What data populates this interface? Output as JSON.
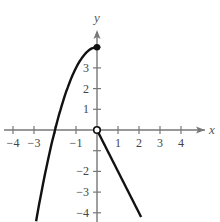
{
  "chart_data": {
    "type": "line",
    "title": "",
    "xlabel": "x",
    "ylabel": "y",
    "xlim": [
      -4.5,
      5
    ],
    "ylim": [
      -4.5,
      5
    ],
    "x_ticks": [
      "-4",
      "-3",
      "-1",
      "1",
      "2",
      "3",
      "4"
    ],
    "y_ticks": [
      "-4",
      "-3",
      "-2",
      "1",
      "2",
      "3"
    ],
    "grid": false,
    "series": [
      {
        "name": "f(x) = 4 - x^2, x <= 0",
        "x": [
          -2.83,
          -2,
          -1,
          0
        ],
        "y": [
          -4,
          0,
          3,
          4
        ],
        "endpoint": {
          "x": 0,
          "y": 4,
          "style": "closed"
        }
      },
      {
        "name": "f(x) = -2x, x > 0",
        "x": [
          0,
          2
        ],
        "y": [
          0,
          -4
        ],
        "endpoint": {
          "x": 0,
          "y": 0,
          "style": "open"
        }
      }
    ]
  },
  "labels": {
    "x_axis": "x",
    "y_axis": "y",
    "xticks": [
      {
        "v": -4,
        "t": "−4"
      },
      {
        "v": -3,
        "t": "−3"
      },
      {
        "v": -1,
        "t": "−1"
      },
      {
        "v": 1,
        "t": "1"
      },
      {
        "v": 2,
        "t": "2"
      },
      {
        "v": 3,
        "t": "3"
      },
      {
        "v": 4,
        "t": "4"
      }
    ],
    "yticks": [
      {
        "v": 3,
        "t": "3"
      },
      {
        "v": 2,
        "t": "2"
      },
      {
        "v": 1,
        "t": "1"
      },
      {
        "v": -2,
        "t": "−2"
      },
      {
        "v": -3,
        "t": "−3"
      },
      {
        "v": -4,
        "t": "−4"
      }
    ]
  }
}
